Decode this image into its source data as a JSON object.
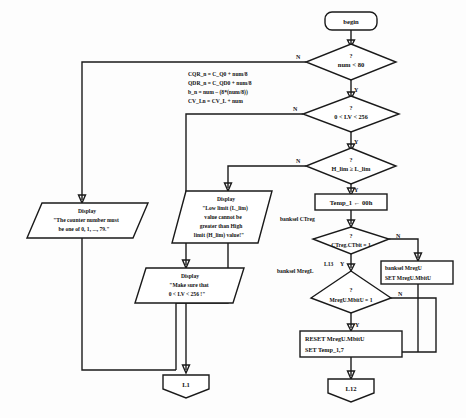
{
  "diagram": {
    "type": "flowchart",
    "colors": {
      "stroke": "#1a1a1a",
      "fill": "#ffffff",
      "background": "#fdfdfd"
    },
    "nodes": {
      "begin": {
        "label": "begin",
        "shape": "terminator-rounded"
      },
      "dec_num": {
        "question": "?",
        "label": "num < 80",
        "shape": "decision"
      },
      "dec_lv": {
        "question": "?",
        "label": "0 < LV < 256",
        "shape": "decision"
      },
      "dec_lim": {
        "question": "?",
        "label": "H_lim ≥ L_lim",
        "shape": "decision"
      },
      "assign": {
        "shape": "process-lines",
        "lines": [
          "CQR_n = C_Q0 + num/8",
          "QDR_n = C_QD0 + num/8",
          "b_n =  num – (8*(num/8))",
          "CV_Ln =  CV_L + num"
        ]
      },
      "disp_counter": {
        "shape": "parallelogram",
        "lines": [
          "Display",
          "\"The counter number must",
          "be one of 0, 1, ..., 79.\""
        ]
      },
      "disp_limit": {
        "shape": "parallelogram",
        "lines": [
          "Display",
          "\"Low limit (L_lim)",
          "value cannot be",
          "greater than High",
          "limit (H_lim) value!\""
        ]
      },
      "disp_lv": {
        "shape": "parallelogram",
        "lines": [
          "Display",
          "\"Make sure that",
          "0 < LV < 256 !\""
        ]
      },
      "temp1": {
        "shape": "process",
        "label": "Temp_1 ← 00h"
      },
      "banksel_ctreg": {
        "shape": "annotation",
        "label": "banksel CTreg"
      },
      "dec_ctreg": {
        "question": "?",
        "label": "CTreg.CTbit = 1",
        "shape": "decision"
      },
      "banksel_mregl": {
        "shape": "annotation",
        "label": "banksel MregL"
      },
      "dec_mregu": {
        "question": "?",
        "label": "MregU.MbitU  = 1",
        "shape": "decision"
      },
      "set_mregu": {
        "shape": "process-lines",
        "lines": [
          "banksel MregU",
          "SET MregU.MbitU"
        ]
      },
      "reset_mregu": {
        "shape": "process-lines",
        "lines": [
          "RESET MregU.MbitU",
          "SET Temp_1,7"
        ]
      },
      "l1": {
        "shape": "connector-pentagon",
        "label": "L1"
      },
      "l12": {
        "shape": "connector-pentagon",
        "label": "L12"
      },
      "l13": {
        "shape": "connector-label",
        "label": "L13"
      }
    },
    "edge_labels": {
      "n": "N",
      "y": "Y"
    }
  }
}
